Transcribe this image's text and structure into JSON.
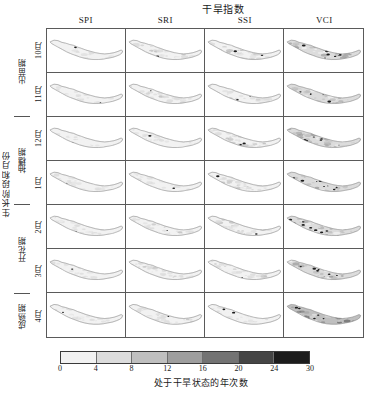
{
  "figure": {
    "title": "干旱指数",
    "stage_axis_label": "生长阶段和月份",
    "columns": [
      "SPI",
      "SRI",
      "SSI",
      "VCI"
    ],
    "months": [
      "10月",
      "11月",
      "12月",
      "1月",
      "2月",
      "3月",
      "4月"
    ],
    "stages": [
      {
        "label": "出苗期",
        "rows": 2
      },
      {
        "label": "抽穗期",
        "rows": 2
      },
      {
        "label": "开花期",
        "rows": 2
      },
      {
        "label": "成熟期",
        "rows": 1
      }
    ]
  },
  "legend": {
    "caption": "处于干旱状态的年次数",
    "ticks": [
      "0",
      "4",
      "8",
      "12",
      "16",
      "20",
      "24",
      "30"
    ],
    "tick_positions_pct": [
      0,
      14.28,
      28.57,
      42.86,
      57.14,
      71.43,
      85.71,
      100
    ],
    "colors": [
      "#f2f2f2",
      "#dcdcdc",
      "#bfbfbf",
      "#9e9e9e",
      "#737373",
      "#454545",
      "#1c1c1c"
    ]
  },
  "chart_data": {
    "type": "heatmap",
    "title": "干旱指数",
    "xlabel": "干旱指数",
    "ylabel": "生长阶段和月份",
    "legend_label": "处于干旱状态的年次数",
    "colorbar_range": [
      0,
      30
    ],
    "colorbar_ticks": [
      0,
      4,
      8,
      12,
      16,
      20,
      24,
      30
    ],
    "grid_rows": 7,
    "grid_cols": 4,
    "categories_x": [
      "SPI",
      "SRI",
      "SSI",
      "VCI"
    ],
    "categories_y": [
      "10月",
      "11月",
      "12月",
      "1月",
      "2月",
      "3月",
      "4月"
    ],
    "region": "Nepal",
    "panel_mean_drought_years": [
      {
        "month": "10月",
        "SPI": 3,
        "SRI": 5,
        "SSI": 6,
        "VCI": 9
      },
      {
        "month": "11月",
        "SPI": 3,
        "SRI": 5,
        "SSI": 5,
        "VCI": 8
      },
      {
        "month": "12月",
        "SPI": 3,
        "SRI": 4,
        "SSI": 6,
        "VCI": 9
      },
      {
        "month": "1月",
        "SPI": 4,
        "SRI": 4,
        "SSI": 5,
        "VCI": 7
      },
      {
        "month": "2月",
        "SPI": 4,
        "SRI": 5,
        "SSI": 6,
        "VCI": 8
      },
      {
        "month": "3月",
        "SPI": 4,
        "SRI": 5,
        "SSI": 5,
        "VCI": 9
      },
      {
        "month": "4月",
        "SPI": 4,
        "SRI": 5,
        "SSI": 4,
        "VCI": 11
      }
    ],
    "panel_max_drought_years": [
      {
        "month": "10月",
        "SPI": 10,
        "SRI": 12,
        "SSI": 14,
        "VCI": 30
      },
      {
        "month": "11月",
        "SPI": 9,
        "SRI": 11,
        "SSI": 12,
        "VCI": 30
      },
      {
        "month": "12月",
        "SPI": 9,
        "SRI": 10,
        "SSI": 13,
        "VCI": 30
      },
      {
        "month": "1月",
        "SPI": 10,
        "SRI": 10,
        "SSI": 12,
        "VCI": 24
      },
      {
        "month": "2月",
        "SPI": 10,
        "SRI": 11,
        "SSI": 13,
        "VCI": 26
      },
      {
        "month": "3月",
        "SPI": 10,
        "SRI": 12,
        "SSI": 12,
        "VCI": 30
      },
      {
        "month": "4月",
        "SPI": 11,
        "SRI": 12,
        "SSI": 10,
        "VCI": 30
      }
    ]
  }
}
